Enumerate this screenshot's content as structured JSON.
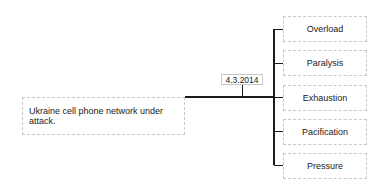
{
  "root": {
    "label": "Ukraine cell phone network under attack."
  },
  "date_label": "4.3.2014",
  "branches": [
    {
      "label": "Overload"
    },
    {
      "label": "Paralysis"
    },
    {
      "label": "Exhaustion"
    },
    {
      "label": "Pacification"
    },
    {
      "label": "Pressure"
    }
  ],
  "colors": {
    "line": "#1a1a1a",
    "border": "#c8c8c8",
    "text": "#222222"
  }
}
